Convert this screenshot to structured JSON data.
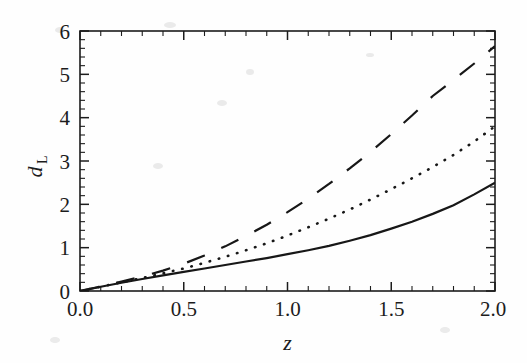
{
  "figure": {
    "background_color": "#fefefe",
    "ink_color": "#1c1c1c"
  },
  "axes": {
    "x_title": "z",
    "y_title_base": "d",
    "y_title_sub": "L",
    "x_ticks": [
      "0.0",
      "0.5",
      "1.0",
      "1.5",
      "2.0"
    ],
    "y_ticks": [
      "0",
      "1",
      "2",
      "3",
      "4",
      "5",
      "6"
    ]
  },
  "chart_data": {
    "type": "line",
    "title": "",
    "xlabel": "z",
    "ylabel": "d_L",
    "xlim": [
      0.0,
      2.0
    ],
    "ylim": [
      0.0,
      6.0
    ],
    "xticks": [
      0.0,
      0.5,
      1.0,
      1.5,
      2.0
    ],
    "yticks": [
      0,
      1,
      2,
      3,
      4,
      5,
      6
    ],
    "x_minor_tick_step": 0.1,
    "y_minor_tick_step": 0.2,
    "grid": false,
    "legend": "none",
    "frame": true,
    "tick_direction": "in",
    "x": [
      0.0,
      0.1,
      0.2,
      0.3,
      0.4,
      0.5,
      0.6,
      0.7,
      0.8,
      0.9,
      1.0,
      1.1,
      1.2,
      1.3,
      1.4,
      1.5,
      1.6,
      1.7,
      1.8,
      1.9,
      2.0
    ],
    "series": [
      {
        "name": "solid-curve",
        "style": "solid",
        "color": "#171717",
        "values": [
          0.0,
          0.098,
          0.19,
          0.277,
          0.36,
          0.44,
          0.52,
          0.6,
          0.68,
          0.76,
          0.85,
          0.94,
          1.04,
          1.16,
          1.29,
          1.44,
          1.6,
          1.78,
          1.98,
          2.23,
          2.5
        ]
      },
      {
        "name": "dotted-curve",
        "style": "dotted",
        "color": "#171717",
        "values": [
          0.0,
          0.1,
          0.2,
          0.3,
          0.41,
          0.52,
          0.65,
          0.79,
          0.94,
          1.1,
          1.28,
          1.47,
          1.67,
          1.88,
          2.11,
          2.35,
          2.6,
          2.86,
          3.14,
          3.45,
          3.8
        ]
      },
      {
        "name": "dashed-curve",
        "style": "dashed",
        "color": "#171717",
        "values": [
          0.0,
          0.103,
          0.215,
          0.335,
          0.47,
          0.63,
          0.82,
          1.03,
          1.27,
          1.53,
          1.82,
          2.13,
          2.47,
          2.83,
          3.21,
          3.62,
          4.05,
          4.5,
          4.87,
          5.25,
          5.65
        ]
      }
    ]
  }
}
